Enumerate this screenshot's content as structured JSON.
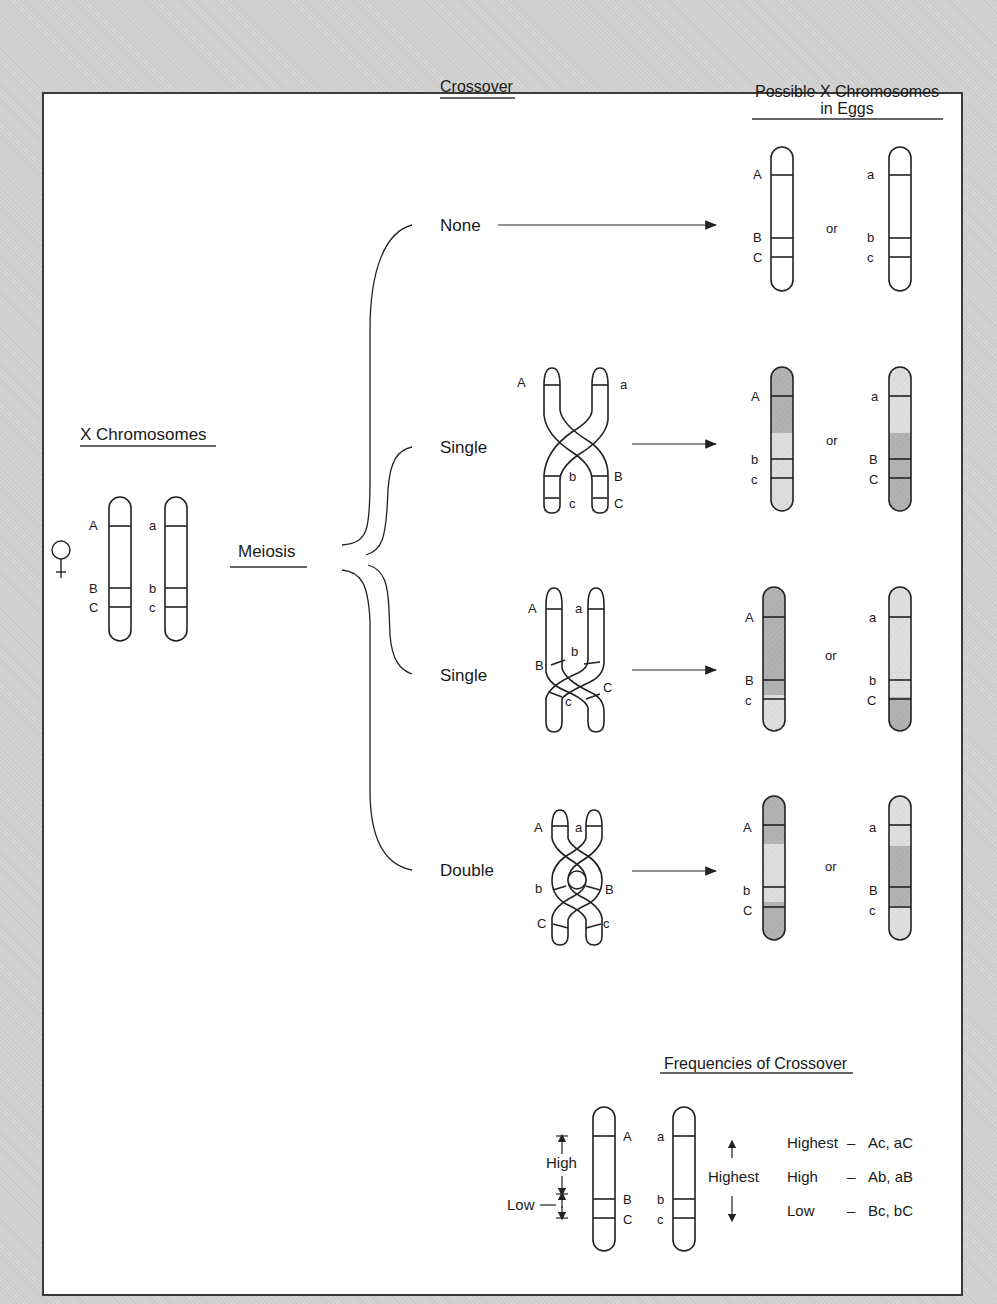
{
  "headers": {
    "crossover": "Crossover",
    "possible_line1": "Possible X Chromosomes",
    "possible_line2": "in Eggs",
    "x_chromosomes": "X Chromosomes",
    "meiosis": "Meiosis",
    "frequencies": "Frequencies of Crossover"
  },
  "female_symbol": "♀",
  "colors": {
    "dark_fill": "#b5b5b5",
    "light_fill": "#dcdcdc",
    "outline": "#222222",
    "background": "#cfcfcf",
    "panel": "#ffffff"
  },
  "parent_chromosomes": {
    "left_genes": [
      "A",
      "B",
      "C"
    ],
    "right_genes": [
      "a",
      "b",
      "c"
    ]
  },
  "branches": [
    {
      "label": "None",
      "crossover_genes": [],
      "outcomes": [
        {
          "genes": [
            "A",
            "B",
            "C"
          ]
        },
        {
          "genes": [
            "a",
            "b",
            "c"
          ]
        }
      ]
    },
    {
      "label": "Single",
      "crossover_genes": {
        "top_left": "A",
        "top_right": "a",
        "mid_left": "b",
        "mid_right": "B",
        "bot_left": "c",
        "bot_right": "C"
      },
      "outcomes": [
        {
          "genes": [
            "A",
            "b",
            "c"
          ]
        },
        {
          "genes": [
            "a",
            "B",
            "C"
          ]
        }
      ]
    },
    {
      "label": "Single",
      "crossover_genes": {
        "top_left": "A",
        "top_right": "a",
        "mid_left": "B",
        "mid_right": "b",
        "bot_left": "c",
        "bot_right": "C"
      },
      "outcomes": [
        {
          "genes": [
            "A",
            "B",
            "c"
          ]
        },
        {
          "genes": [
            "a",
            "b",
            "C"
          ]
        }
      ]
    },
    {
      "label": "Double",
      "crossover_genes": {
        "top_left": "A",
        "top_right": "a",
        "mid_left": "b",
        "mid_right": "B",
        "bot_left": "C",
        "bot_right": "c"
      },
      "outcomes": [
        {
          "genes": [
            "A",
            "b",
            "C"
          ]
        },
        {
          "genes": [
            "a",
            "B",
            "c"
          ]
        }
      ]
    }
  ],
  "or_label": "or",
  "frequency_legend": {
    "left_genes": [
      "A",
      "B",
      "C"
    ],
    "right_genes": [
      "a",
      "b",
      "c"
    ],
    "high_label": "High",
    "low_label": "Low",
    "highest_label": "Highest",
    "rows": [
      {
        "level": "Highest",
        "dash": "–",
        "pairs": "Ac, aC"
      },
      {
        "level": "High",
        "dash": "–",
        "pairs": "Ab, aB"
      },
      {
        "level": "Low",
        "dash": "–",
        "pairs": "Bc, bC"
      }
    ]
  }
}
